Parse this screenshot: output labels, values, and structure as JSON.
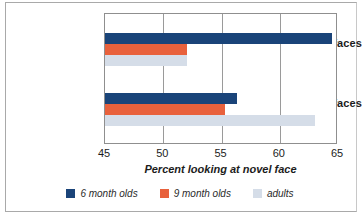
{
  "chart_data": {
    "type": "bar",
    "orientation": "horizontal",
    "title": "",
    "xlabel": "Percent looking at novel face",
    "ylabel": "",
    "xlim": [
      45,
      65
    ],
    "xticks": [
      45,
      50,
      55,
      60,
      65
    ],
    "xtick_labels": [
      "45",
      "50",
      "55",
      "60",
      "65"
    ],
    "grid": true,
    "grid_axis": "x",
    "legend_position": "bottom",
    "categories": [
      "Monkey faces",
      "Human faces"
    ],
    "series": [
      {
        "name": "6 month olds",
        "color": "#1a4479",
        "values": [
          64.5,
          56.3
        ]
      },
      {
        "name": "9 month olds",
        "color": "#e8613c",
        "values": [
          52.0,
          55.3
        ]
      },
      {
        "name": "adults",
        "color": "#d5dde8",
        "values": [
          52.0,
          63.0
        ]
      }
    ]
  },
  "axis": {
    "title": "Percent looking at novel face",
    "tick_0": "45",
    "tick_1": "50",
    "tick_2": "55",
    "tick_3": "60",
    "tick_4": "65"
  },
  "categories": {
    "monkey": "Monkey faces",
    "human": "Human faces"
  },
  "legend": {
    "items": [
      {
        "label": "6 month olds",
        "color": "#1a4479"
      },
      {
        "label": "9 month olds",
        "color": "#e8613c"
      },
      {
        "label": "adults",
        "color": "#d5dde8"
      }
    ]
  },
  "colors": {
    "series_6mo": "#1a4479",
    "series_9mo": "#e8613c",
    "series_adults": "#d5dde8",
    "plot_border": "#8f8f8f",
    "gridline": "#9a9a9a",
    "frame": "#a9a9a9",
    "background": "#ffffff",
    "text": "#1c1c1c"
  }
}
